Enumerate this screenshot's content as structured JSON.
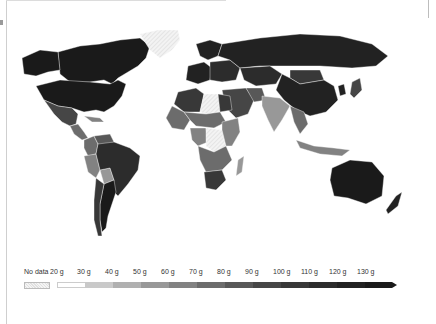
{
  "map": {
    "title": "",
    "style": "grayscale-choropleth",
    "regions": [
      {
        "name": "Canada",
        "bin": 12
      },
      {
        "name": "United States",
        "bin": 12
      },
      {
        "name": "Alaska",
        "bin": 12
      },
      {
        "name": "Greenland",
        "bin": "no-data"
      },
      {
        "name": "Mexico",
        "bin": 8
      },
      {
        "name": "Central America",
        "bin": 6
      },
      {
        "name": "Caribbean",
        "bin": 5
      },
      {
        "name": "Colombia",
        "bin": 6
      },
      {
        "name": "Venezuela",
        "bin": 7
      },
      {
        "name": "Peru",
        "bin": 5
      },
      {
        "name": "Bolivia",
        "bin": 4
      },
      {
        "name": "Brazil",
        "bin": 10
      },
      {
        "name": "Argentina",
        "bin": 12
      },
      {
        "name": "Chile",
        "bin": 9
      },
      {
        "name": "Western Europe",
        "bin": 11
      },
      {
        "name": "Scandinavia",
        "bin": 11
      },
      {
        "name": "Eastern Europe",
        "bin": 10
      },
      {
        "name": "Russia",
        "bin": 11
      },
      {
        "name": "Kazakhstan",
        "bin": 10
      },
      {
        "name": "Mongolia",
        "bin": 9
      },
      {
        "name": "China",
        "bin": 11
      },
      {
        "name": "Japan",
        "bin": 8
      },
      {
        "name": "Korea",
        "bin": 11
      },
      {
        "name": "Middle East",
        "bin": 8
      },
      {
        "name": "Iran",
        "bin": 7
      },
      {
        "name": "India",
        "bin": 4
      },
      {
        "name": "Southeast Asia",
        "bin": 6
      },
      {
        "name": "Indonesia",
        "bin": 5
      },
      {
        "name": "Australia",
        "bin": 12
      },
      {
        "name": "New Zealand",
        "bin": 11
      },
      {
        "name": "Algeria",
        "bin": 9
      },
      {
        "name": "Libya",
        "bin": "no-data"
      },
      {
        "name": "Egypt",
        "bin": 9
      },
      {
        "name": "West Africa",
        "bin": 6
      },
      {
        "name": "Sahel",
        "bin": 6
      },
      {
        "name": "Central Africa",
        "bin": 5
      },
      {
        "name": "DR Congo",
        "bin": "no-data"
      },
      {
        "name": "East Africa",
        "bin": 5
      },
      {
        "name": "Southern Africa",
        "bin": 6
      },
      {
        "name": "South Africa",
        "bin": 9
      },
      {
        "name": "Madagascar",
        "bin": 4
      }
    ]
  },
  "legend": {
    "no_data_label": "No data",
    "bins": [
      "20 g",
      "30 g",
      "40 g",
      "50 g",
      "60 g",
      "70 g",
      "80 g",
      "90 g",
      "100 g",
      "110 g",
      "120 g",
      "130 g"
    ],
    "colors": [
      "#ffffff",
      "#e3e3e3",
      "#c9c9c9",
      "#b0b0b0",
      "#989898",
      "#828282",
      "#6c6c6c",
      "#585858",
      "#464646",
      "#383838",
      "#2c2c2c",
      "#222222",
      "#1a1a1a"
    ],
    "no_data_color": "#efefef"
  }
}
